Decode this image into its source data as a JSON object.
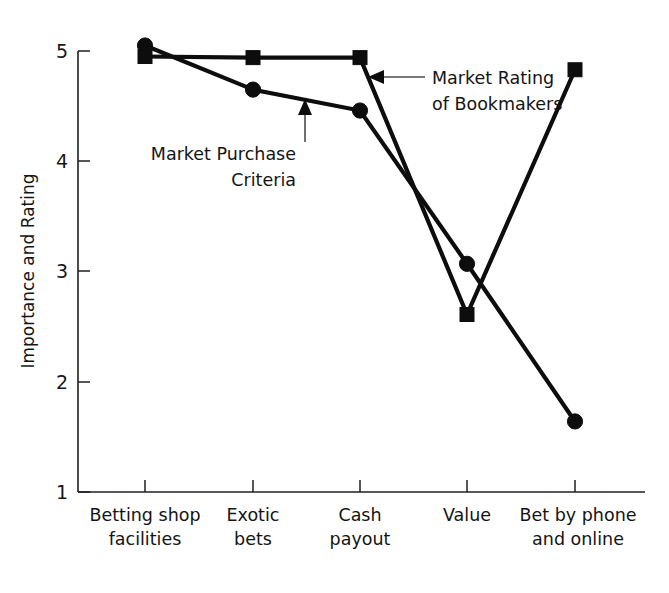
{
  "chart_data": {
    "type": "line",
    "title": "",
    "xlabel": "",
    "ylabel": "Importance and Rating",
    "ylim": [
      1,
      5
    ],
    "yticks": [
      1,
      2,
      3,
      4,
      5
    ],
    "ytick_labels": [
      "1",
      "2",
      "3",
      "4",
      "5"
    ],
    "grid": false,
    "legend_position": "inline-annotations",
    "categories": [
      "Betting shop\nfacilities",
      "Exotic\nbets",
      "Cash\npayout",
      "Value",
      "Bet by phone\nand online"
    ],
    "category_lines": [
      [
        "Betting shop",
        "facilities"
      ],
      [
        "Exotic",
        "bets"
      ],
      [
        "Cash",
        "payout"
      ],
      [
        "Value",
        ""
      ],
      [
        "Bet by phone",
        "and online"
      ]
    ],
    "series": [
      {
        "name": "Market Purchase Criteria",
        "marker": "circle",
        "values": [
          5.05,
          4.65,
          4.46,
          3.07,
          1.64
        ]
      },
      {
        "name": "Market Rating of Bookmakers",
        "marker": "square",
        "values": [
          4.95,
          4.94,
          4.94,
          2.61,
          4.83
        ]
      }
    ],
    "annotations": [
      {
        "id": "annot-market-purchase-criteria",
        "lines": [
          "Market Purchase",
          "Criteria"
        ],
        "points_to_series": "Market Purchase Criteria"
      },
      {
        "id": "annot-market-rating-bookmakers",
        "lines": [
          "Market Rating",
          "of Bookmakers"
        ],
        "points_to_series": "Market Rating of Bookmakers"
      }
    ],
    "colors": {
      "line": "#0d0d0d",
      "axis": "#1f1f1f",
      "text": "#141414",
      "annotation_leader": "#4d4d4d",
      "background": "#ffffff"
    }
  }
}
